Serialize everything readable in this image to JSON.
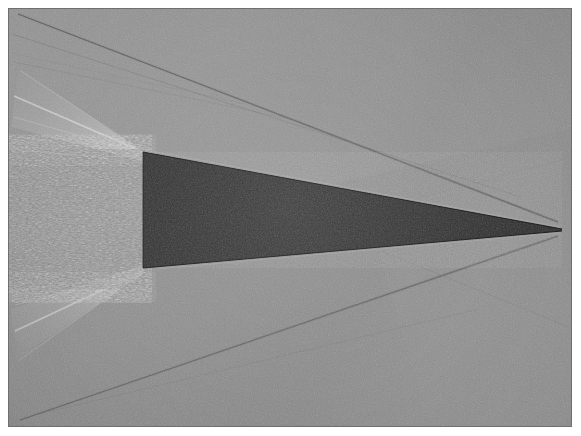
{
  "figure": {
    "kind": "schlieren-photograph",
    "flow_direction": "right-to-left",
    "title": "",
    "caption": "",
    "width_px": 581,
    "height_px": 436
  },
  "plate": {
    "left": 9,
    "top": 9,
    "width": 562,
    "height": 417,
    "border_color": "#6f6f6f",
    "background_color": "#8b8b8b",
    "margin_color": "#ffffff"
  },
  "palette": {
    "page_background": "#ffffff",
    "field_light_gray": "#9a9a9a",
    "field_mid_gray": "#8b8b8b",
    "field_dark_gray": "#7e7e7e",
    "model_silhouette": "#262626",
    "model_silhouette_edge": "#1b1b1b",
    "shock_dark": "#5c5c5c",
    "expansion_bright": "#cfcfcf",
    "wake_tone": "#828282"
  },
  "model": {
    "name": "sharp-wedge",
    "tip_x": 562,
    "tip_y": 229,
    "base_x": 143,
    "base_top_y": 152,
    "base_bottom_y": 268,
    "base_height_px": 116,
    "chord_px": 419,
    "half_angle_deg": 7.9,
    "fill": "#262626"
  },
  "features": [
    {
      "name": "leading-edge-oblique-shock-upper",
      "type": "oblique-shock",
      "from": [
        558,
        222
      ],
      "to": [
        18,
        14
      ],
      "tone": "#5e5e5e",
      "thickness_px": 1.4
    },
    {
      "name": "leading-edge-oblique-shock-lower",
      "type": "oblique-shock",
      "from": [
        558,
        236
      ],
      "to": [
        20,
        420
      ],
      "tone": "#5e5e5e",
      "thickness_px": 1.3
    },
    {
      "name": "secondary-mach-wave-upper",
      "type": "mach-wave",
      "from": [
        520,
        196
      ],
      "to": [
        12,
        34
      ],
      "tone": "#6a6a6a",
      "thickness_px": 1.0
    },
    {
      "name": "secondary-mach-wave-upper-2",
      "type": "mach-wave",
      "from": [
        300,
        120
      ],
      "to": [
        14,
        62
      ],
      "tone": "#727272",
      "thickness_px": 0.9
    },
    {
      "name": "shoulder-expansion-fan-upper",
      "type": "expansion-fan",
      "origin": [
        143,
        152
      ],
      "tone": "#c8c8c8"
    },
    {
      "name": "shoulder-expansion-fan-lower",
      "type": "expansion-fan",
      "origin": [
        143,
        268
      ],
      "tone": "#bfbfbf"
    },
    {
      "name": "recompression-shock-upper",
      "type": "recompression-shock",
      "from": [
        143,
        152
      ],
      "to": [
        14,
        96
      ],
      "tone": "#c9c9c9",
      "thickness_px": 1.6
    },
    {
      "name": "recompression-shock-lower",
      "type": "recompression-shock",
      "from": [
        143,
        268
      ],
      "to": [
        16,
        330
      ],
      "tone": "#c4c4c4",
      "thickness_px": 1.6
    },
    {
      "name": "turbulent-wake",
      "type": "turbulent-wake",
      "left": 0,
      "top": 152,
      "width": 143,
      "height": 116,
      "tone": "#848484"
    }
  ],
  "annotations": {
    "scale_bar": "",
    "labels": []
  }
}
